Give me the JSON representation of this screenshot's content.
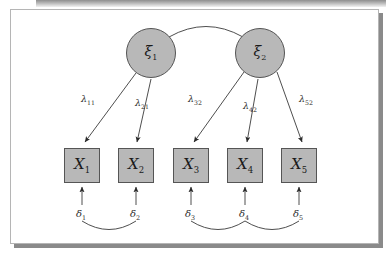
{
  "figure": {
    "type": "path-diagram",
    "model": "confirmatory-factor-analysis",
    "colors": {
      "node_fill": "#b8b8b8",
      "node_stroke": "#555555",
      "path_stroke": "#3a3a3a",
      "panel_background": "#ffffff",
      "frame_border": "#b5b5b5",
      "shadow": "#8a8a8a"
    }
  },
  "latent_variables": [
    {
      "id": "xi1",
      "symbol": "ξ",
      "subscript": "1",
      "cx": 140,
      "cy": 43
    },
    {
      "id": "xi2",
      "symbol": "ξ",
      "subscript": "2",
      "cx": 249,
      "cy": 43
    }
  ],
  "observed_variables": [
    {
      "id": "x1",
      "symbol": "X",
      "subscript": "1",
      "cx": 71,
      "cy": 155
    },
    {
      "id": "x2",
      "symbol": "X",
      "subscript": "2",
      "cx": 125,
      "cy": 155
    },
    {
      "id": "x3",
      "symbol": "X",
      "subscript": "3",
      "cx": 180,
      "cy": 155
    },
    {
      "id": "x4",
      "symbol": "X",
      "subscript": "4",
      "cx": 234,
      "cy": 155
    },
    {
      "id": "x5",
      "symbol": "X",
      "subscript": "5",
      "cx": 288,
      "cy": 155
    }
  ],
  "loadings": [
    {
      "id": "lambda11",
      "symbol": "λ",
      "subscript": "11",
      "from": "xi1",
      "to": "x1",
      "label_x": 79,
      "label_y": 90
    },
    {
      "id": "lambda21",
      "symbol": "λ",
      "subscript": "21",
      "from": "xi1",
      "to": "x2",
      "label_x": 131,
      "label_y": 93
    },
    {
      "id": "lambda32",
      "symbol": "λ",
      "subscript": "32",
      "from": "xi2",
      "to": "x3",
      "label_x": 186,
      "label_y": 90
    },
    {
      "id": "lambda42",
      "symbol": "λ",
      "subscript": "42",
      "from": "xi2",
      "to": "x4",
      "label_x": 240,
      "label_y": 95
    },
    {
      "id": "lambda52",
      "symbol": "λ",
      "subscript": "52",
      "from": "xi2",
      "to": "x5",
      "label_x": 296,
      "label_y": 90
    }
  ],
  "errors": [
    {
      "id": "delta1",
      "symbol": "δ",
      "subscript": "1",
      "to": "x1",
      "label_x": 71,
      "label_y": 205
    },
    {
      "id": "delta2",
      "symbol": "δ",
      "subscript": "2",
      "to": "x2",
      "label_x": 125,
      "label_y": 205
    },
    {
      "id": "delta3",
      "symbol": "δ",
      "subscript": "3",
      "to": "x3",
      "label_x": 180,
      "label_y": 205
    },
    {
      "id": "delta4",
      "symbol": "δ",
      "subscript": "4",
      "to": "x4",
      "label_x": 234,
      "label_y": 205
    },
    {
      "id": "delta5",
      "symbol": "δ",
      "subscript": "5",
      "to": "x5",
      "label_x": 288,
      "label_y": 205
    }
  ],
  "covariances": [
    {
      "id": "cov-xi1-xi2",
      "between": [
        "xi1",
        "xi2"
      ],
      "style": "arc-above",
      "arrowheads": "none"
    },
    {
      "id": "cov-delta1-delta2",
      "between": [
        "delta1",
        "delta2"
      ],
      "style": "arc-below",
      "arrowheads": "none"
    },
    {
      "id": "cov-delta3-delta4",
      "between": [
        "delta3",
        "delta4"
      ],
      "style": "arc-below",
      "arrowheads": "none"
    },
    {
      "id": "cov-delta4-delta5",
      "between": [
        "delta4",
        "delta5"
      ],
      "style": "arc-below",
      "arrowheads": "none"
    }
  ]
}
